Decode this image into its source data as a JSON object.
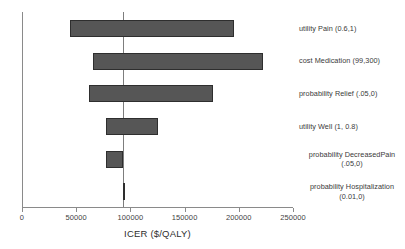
{
  "chart_data": {
    "type": "bar",
    "subtype": "tornado",
    "title": "",
    "xlabel": "ICER ($/QALY)",
    "ylabel": "",
    "xlim": [
      0,
      250000
    ],
    "xticks": [
      0,
      50000,
      100000,
      150000,
      200000,
      250000
    ],
    "xticklabels": [
      "0",
      "50000",
      "100000",
      "150000",
      "200000",
      "250000"
    ],
    "grid": false,
    "legend": null,
    "baseline": 92500,
    "orientation": "horizontal",
    "bar_color": "#565656",
    "categories": [
      "utility Pain (0.6,1)",
      "cost Medication (99,300)",
      "probability Relief (.05,0)",
      "utility Well (1, 0.8)",
      "probability DecreasedPain (.05,0)",
      "probability Hospitalization (0.01,0)"
    ],
    "bars": [
      {
        "label": "utility Pain (0.6,1)",
        "low": 43000,
        "high": 195000,
        "range": 152000
      },
      {
        "label": "cost Medication (99,300)",
        "low": 64500,
        "high": 221500,
        "range": 157000
      },
      {
        "label": "probability Relief (.05,0)",
        "low": 61000,
        "high": 175000,
        "range": 114000
      },
      {
        "label": "utility Well (1, 0.8)",
        "low": 77000,
        "high": 125000,
        "range": 48000
      },
      {
        "label": "probability DecreasedPain (.05,0)",
        "low": 77000,
        "high": 92500,
        "range": 15500
      },
      {
        "label": "probability Hospitalization (0.01,0)",
        "low": 92000,
        "high": 93500,
        "range": 1500
      }
    ]
  },
  "axis": {
    "xlabel": "ICER ($/QALY)",
    "ticklabels": [
      "0",
      "50000",
      "100000",
      "150000",
      "200000",
      "250000"
    ]
  },
  "labels": [
    {
      "line1": "utility Pain (0.6,1)",
      "line2": ""
    },
    {
      "line1": "cost Medication (99,300)",
      "line2": ""
    },
    {
      "line1": "probability Relief (.05,0)",
      "line2": ""
    },
    {
      "line1": "utility Well (1, 0.8)",
      "line2": ""
    },
    {
      "line1": "probability DecreasedPain",
      "line2": "(.05,0)"
    },
    {
      "line1": "probability Hospitalization",
      "line2": "(0.01,0)"
    }
  ]
}
